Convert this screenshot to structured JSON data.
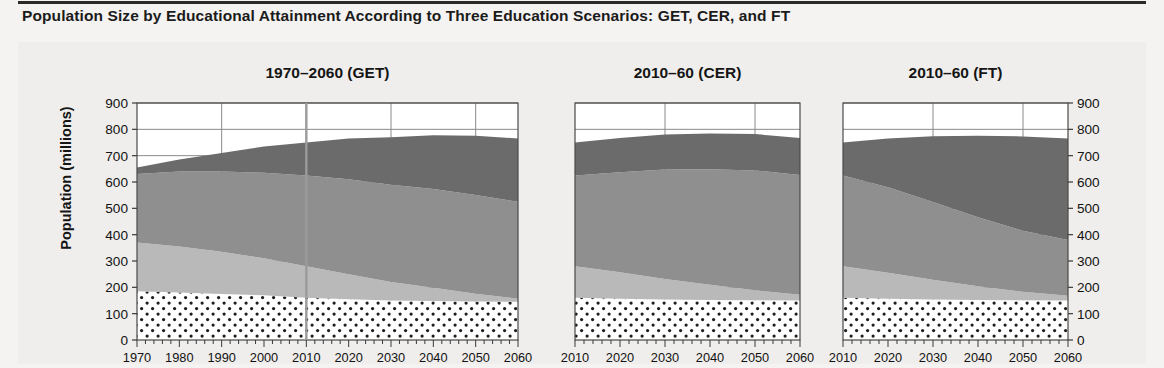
{
  "figure": {
    "title": "Population Size by Educational Attainment According to Three Education Scenarios: GET, CER, and FT",
    "y_axis_label": "Population (millions)"
  },
  "chart_data": {
    "type": "area",
    "title": "Population Size by Educational Attainment According to Three Education Scenarios: GET, CER, and FT",
    "xlabel": "",
    "ylabel": "Population (millions)",
    "ylim": [
      0,
      900
    ],
    "ytick_values": [
      0,
      100,
      200,
      300,
      400,
      500,
      600,
      700,
      800,
      900
    ],
    "ytick_labels": [
      "0",
      "100",
      "200",
      "300",
      "400",
      "500",
      "600",
      "700",
      "800",
      "900"
    ],
    "grid": true,
    "legend_position": "none",
    "stacked": true,
    "series_names": [
      "No education",
      "Primary",
      "Secondary",
      "Tertiary"
    ],
    "series_colors": [
      "#ffffff",
      "#b9b9b9",
      "#8f8f8f",
      "#6b6b6b"
    ],
    "series_patterns": [
      "dots",
      "solid",
      "solid",
      "solid"
    ],
    "panels": [
      {
        "id": "get",
        "title": "1970–2060 (GET)",
        "xlim": [
          1970,
          2060
        ],
        "xtick_values": [
          1970,
          1980,
          1990,
          2000,
          2010,
          2020,
          2030,
          2040,
          2050,
          2060
        ],
        "xtick_labels": [
          "1970",
          "1980",
          "1990",
          "2000",
          "2010",
          "2020",
          "2030",
          "2040",
          "2050",
          "2060"
        ],
        "reference_line_x": 2010,
        "x": [
          1970,
          1980,
          1990,
          2000,
          2010,
          2020,
          2030,
          2040,
          2050,
          2060
        ],
        "series": [
          {
            "name": "No education",
            "values": [
              185,
              180,
              175,
              170,
              160,
              155,
              150,
              148,
              146,
              145
            ]
          },
          {
            "name": "Primary",
            "values": [
              185,
              175,
              160,
              140,
              120,
              95,
              70,
              50,
              30,
              12
            ]
          },
          {
            "name": "Secondary",
            "values": [
              260,
              285,
              305,
              325,
              345,
              360,
              370,
              375,
              375,
              368
            ]
          },
          {
            "name": "Tertiary",
            "values": [
              25,
              45,
              70,
              100,
              125,
              155,
              180,
              205,
              225,
              240
            ]
          }
        ],
        "totals": [
          655,
          685,
          710,
          735,
          750,
          765,
          770,
          778,
          776,
          765
        ]
      },
      {
        "id": "cer",
        "title": "2010–60 (CER)",
        "xlim": [
          2010,
          2060
        ],
        "xtick_values": [
          2010,
          2020,
          2030,
          2040,
          2050,
          2060
        ],
        "xtick_labels": [
          "2010",
          "2020",
          "2030",
          "2040",
          "2050",
          "2060"
        ],
        "reference_line_x": null,
        "x": [
          2010,
          2020,
          2030,
          2040,
          2050,
          2060
        ],
        "series": [
          {
            "name": "No education",
            "values": [
              160,
              157,
              154,
              152,
              151,
              150
            ]
          },
          {
            "name": "Primary",
            "values": [
              120,
              100,
              78,
              58,
              38,
              22
            ]
          },
          {
            "name": "Secondary",
            "values": [
              345,
              380,
              415,
              438,
              455,
              455
            ]
          },
          {
            "name": "Tertiary",
            "values": [
              125,
              130,
              133,
              136,
              138,
              140
            ]
          }
        ],
        "totals": [
          750,
          767,
          780,
          784,
          782,
          767
        ]
      },
      {
        "id": "ft",
        "title": "2010–60 (FT)",
        "xlim": [
          2010,
          2060
        ],
        "xtick_values": [
          2010,
          2020,
          2030,
          2040,
          2050,
          2060
        ],
        "xtick_labels": [
          "2010",
          "2020",
          "2030",
          "2040",
          "2050",
          "2060"
        ],
        "reference_line_x": null,
        "x": [
          2010,
          2020,
          2030,
          2040,
          2050,
          2060
        ],
        "series": [
          {
            "name": "No education",
            "values": [
              160,
              157,
              154,
              152,
              151,
              150
            ]
          },
          {
            "name": "Primary",
            "values": [
              120,
              98,
              75,
              52,
              32,
              18
            ]
          },
          {
            "name": "Secondary",
            "values": [
              345,
              325,
              295,
              262,
              232,
              212
            ]
          },
          {
            "name": "Tertiary",
            "values": [
              125,
              185,
              250,
              310,
              358,
              385
            ]
          }
        ],
        "totals": [
          750,
          765,
          774,
          776,
          773,
          765
        ]
      }
    ]
  }
}
